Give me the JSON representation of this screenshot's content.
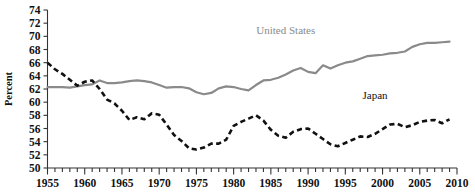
{
  "figure": {
    "background_color": "#ffffff",
    "axis_color": "#333333"
  },
  "chart_data": {
    "type": "line",
    "title": "",
    "xlabel": "",
    "ylabel": "Percent",
    "xlim": [
      1955,
      2010
    ],
    "ylim": [
      50,
      74
    ],
    "ytick_step": 2,
    "xtick_major_step": 5,
    "xtick_minor_step": 1,
    "grid": false,
    "legend_position": "inline-annotations",
    "yticks": [
      50,
      52,
      54,
      56,
      58,
      60,
      62,
      64,
      66,
      68,
      70,
      72,
      74
    ],
    "xticks": [
      1955,
      1960,
      1965,
      1970,
      1975,
      1980,
      1985,
      1990,
      1995,
      2000,
      2005,
      2010
    ],
    "x": [
      1955,
      1956,
      1957,
      1958,
      1959,
      1960,
      1961,
      1962,
      1963,
      1964,
      1965,
      1966,
      1967,
      1968,
      1969,
      1970,
      1971,
      1972,
      1973,
      1974,
      1975,
      1976,
      1977,
      1978,
      1979,
      1980,
      1981,
      1982,
      1983,
      1984,
      1985,
      1986,
      1987,
      1988,
      1989,
      1990,
      1991,
      1992,
      1993,
      1994,
      1995,
      1996,
      1997,
      1998,
      1999,
      2000,
      2001,
      2002,
      2003,
      2004,
      2005,
      2006,
      2007,
      2008,
      2009
    ],
    "series": [
      {
        "name": "United States",
        "color": "#8a8a8a",
        "style": "solid",
        "label_x": 1987,
        "label_y": 70.4,
        "values": [
          62.3,
          62.3,
          62.3,
          62.2,
          62.4,
          62.6,
          62.7,
          63.3,
          62.9,
          62.9,
          63.0,
          63.2,
          63.3,
          63.2,
          63.0,
          62.6,
          62.2,
          62.3,
          62.3,
          62.1,
          61.5,
          61.2,
          61.4,
          62.1,
          62.4,
          62.3,
          62.0,
          61.8,
          62.6,
          63.3,
          63.4,
          63.7,
          64.2,
          64.8,
          65.2,
          64.6,
          64.4,
          65.6,
          65.1,
          65.6,
          66.0,
          66.2,
          66.6,
          67.0,
          67.1,
          67.2,
          67.4,
          67.5,
          67.7,
          68.4,
          68.8,
          69.0,
          69.0,
          69.1,
          69.2
        ]
      },
      {
        "name": "Japan",
        "color": "#111111",
        "style": "dashed",
        "label_x": 1999,
        "label_y": 60.5,
        "values": [
          66.0,
          65.0,
          64.3,
          63.4,
          62.5,
          63.1,
          63.3,
          62.0,
          60.4,
          59.8,
          58.7,
          57.3,
          57.7,
          57.4,
          58.3,
          58.1,
          56.6,
          55.0,
          54.1,
          53.0,
          52.8,
          53.1,
          53.7,
          53.7,
          54.3,
          56.4,
          57.0,
          57.5,
          58.0,
          57.2,
          55.8,
          54.9,
          54.6,
          55.5,
          55.9,
          56.0,
          55.2,
          54.4,
          53.6,
          53.3,
          53.8,
          54.3,
          54.8,
          54.7,
          55.2,
          55.9,
          56.6,
          56.7,
          56.2,
          56.5,
          57.0,
          57.2,
          57.3,
          56.8,
          57.4
        ]
      }
    ]
  },
  "y_axis": {
    "title": "Percent"
  }
}
